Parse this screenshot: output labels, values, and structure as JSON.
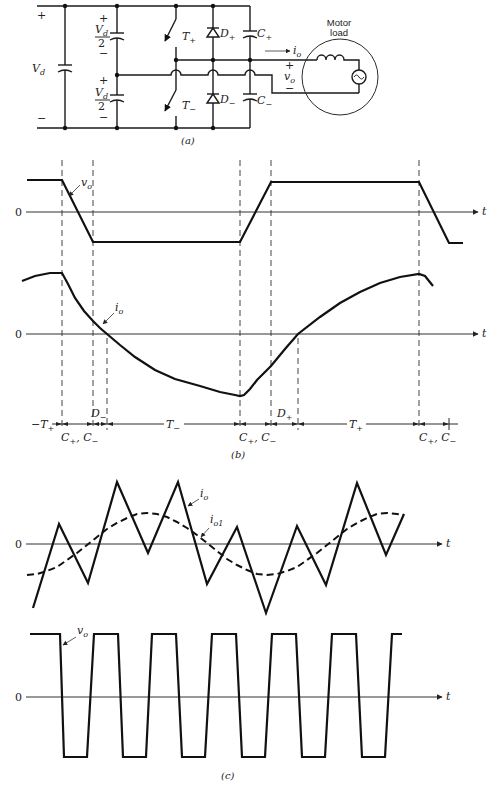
{
  "figure": {
    "part_a_caption": "(a)",
    "part_b_caption": "(b)",
    "part_c_caption": "(c)"
  },
  "circuit": {
    "dc_source": {
      "plus": "+",
      "minus": "−",
      "label": {
        "main": "V",
        "sub": "d"
      }
    },
    "upper_half_capacitor": {
      "plus": "+",
      "minus": "−",
      "numerator": {
        "main": "V",
        "sub": "d"
      },
      "denominator": "2"
    },
    "lower_half_capacitor": {
      "plus": "+",
      "minus": "−",
      "numerator": {
        "main": "V",
        "sub": "d"
      },
      "denominator": "2"
    },
    "switch_upper": {
      "main": "T",
      "sub": "+"
    },
    "switch_lower": {
      "main": "T",
      "sub": "−"
    },
    "diode_upper": {
      "main": "D",
      "sub": "+"
    },
    "diode_lower": {
      "main": "D",
      "sub": "−"
    },
    "snubber_cap_upper": {
      "main": "C",
      "sub": "+"
    },
    "snubber_cap_lower": {
      "main": "C",
      "sub": "−"
    },
    "load": {
      "title_line1": "Motor",
      "title_line2": "load"
    },
    "output_current": {
      "main": "i",
      "sub": "o"
    },
    "output_voltage": {
      "plus": "+",
      "main": "v",
      "sub": "o",
      "minus": "−"
    }
  },
  "part_b": {
    "voltage_plot": {
      "zero": "0",
      "axis": "t",
      "label": {
        "main": "v",
        "sub": "o"
      }
    },
    "current_plot": {
      "zero": "0",
      "axis": "t",
      "label": {
        "main": "i",
        "sub": "o"
      }
    },
    "intervals": [
      {
        "main": "−T",
        "sub": "+"
      },
      {
        "a": "C",
        "a_sub": "+",
        "sep": ", ",
        "b": "C",
        "b_sub": "−"
      },
      {
        "main": "D",
        "sub": "−"
      },
      {
        "main": "T",
        "sub": "−"
      },
      {
        "a": "C",
        "a_sub": "+",
        "sep": ", ",
        "b": "C",
        "b_sub": "−"
      },
      {
        "main": "D",
        "sub": "+"
      },
      {
        "main": "T",
        "sub": "+"
      },
      {
        "a": "C",
        "a_sub": "+",
        "sep": ", ",
        "b": "C",
        "b_sub": "−"
      }
    ]
  },
  "part_c": {
    "current_plot": {
      "zero": "0",
      "axis": "t",
      "label": {
        "main": "i",
        "sub": "o"
      },
      "fundamental_label": {
        "main": "i",
        "sub": "o1"
      }
    },
    "voltage_plot": {
      "zero": "0",
      "axis": "t",
      "label": {
        "main": "v",
        "sub": "o"
      }
    }
  },
  "waveforms": {
    "b_output_voltage": "27,180 62,180 93,242 240,242 271,182 419,182 449,243 463,243",
    "b_output_current": "22,281 35,276 50,273 62,273 68,284 75,298 84,311 93,321 100,328 107,334 120,345 135,357 155,370 175,379 200,386 220,392 235,395 240,396 244,395 250,389 257,380 267,370 271,366 285,349 298,334 320,317 340,303 360,292 380,283 400,277 419,274 425,276 433,286",
    "c_output_current": "33,608 59,524 88,583 117,482 148,553 178,482 207,584 237,527 266,613 297,526 326,585 357,483 386,555 404,514",
    "c_fundamental_current": "27,575 37,574 47,571 57,567 67,560 77,553 87,545 97,537 107,529 117,523 127,518 137,514 147,513 157,514 167,517 177,522 187,528 197,535 207,543 217,551 227,559 237,565 247,570 257,574 267,575 277,574 287,571 297,567 307,560 317,553 327,545 337,537 347,529 357,523 367,518 377,514 387,513 397,514 404,515",
    "c_output_voltage": "30,634 60,634 64,757 87,757 94,634 118,634 123,757 146,757 152,634 176,634 182,757 205,757 212,634 236,634 242,757 265,757 272,634 296,634 302,757 325,757 332,634 356,634 362,757 385,757 392,634 402,634"
  }
}
